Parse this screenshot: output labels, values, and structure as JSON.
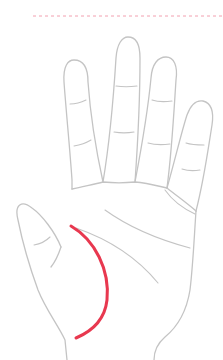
{
  "diagram": {
    "highlighted_line": "life-line",
    "colors": {
      "highlight": "#e8384f",
      "outline": "#c4c4c4",
      "guide": "#f2a0b0",
      "background": "#ffffff"
    },
    "guide_line": {
      "style": "dashed",
      "y": 16,
      "x_start": 33,
      "x_end": 223
    }
  }
}
